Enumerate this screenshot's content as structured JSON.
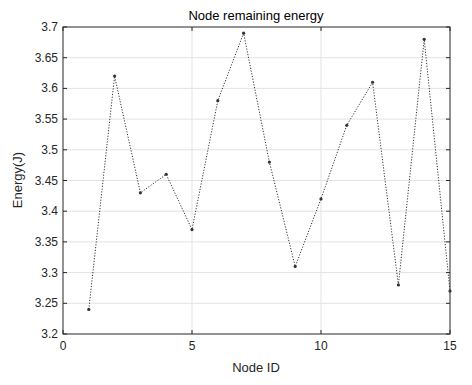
{
  "chart_data": {
    "type": "line",
    "title": "Node remaining energy",
    "xlabel": "Node ID",
    "ylabel": "Energy(J)",
    "xlim": [
      0,
      15
    ],
    "ylim": [
      3.2,
      3.7
    ],
    "xticks": [
      0,
      5,
      10,
      15
    ],
    "xtick_labels": [
      "0",
      "5",
      "10",
      "15"
    ],
    "yticks": [
      3.2,
      3.25,
      3.3,
      3.35,
      3.4,
      3.45,
      3.5,
      3.55,
      3.6,
      3.65,
      3.7
    ],
    "ytick_labels": [
      "3.2",
      "3.25",
      "3.3",
      "3.35",
      "3.4",
      "3.45",
      "3.5",
      "3.55",
      "3.6",
      "3.65",
      "3.7"
    ],
    "grid": true,
    "legend": null,
    "series": [
      {
        "name": "Remaining energy",
        "line_style": "dotted",
        "marker": "dot",
        "color": "#333333",
        "x": [
          1,
          2,
          3,
          4,
          5,
          6,
          7,
          8,
          9,
          10,
          11,
          12,
          13,
          14,
          15
        ],
        "values": [
          3.24,
          3.62,
          3.43,
          3.46,
          3.37,
          3.58,
          3.69,
          3.48,
          3.31,
          3.42,
          3.54,
          3.61,
          3.28,
          3.68,
          3.27
        ]
      }
    ]
  },
  "colors": {
    "axis": "#262626",
    "grid": "#e3e3e3",
    "line": "#333333"
  }
}
